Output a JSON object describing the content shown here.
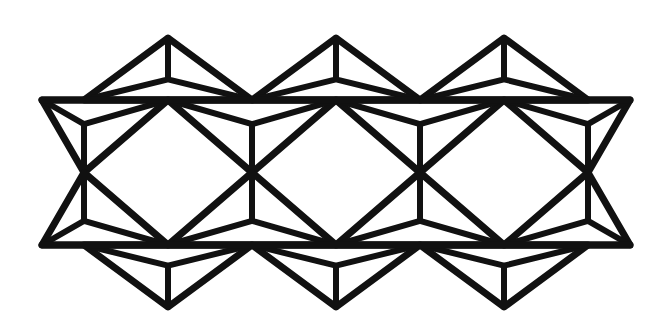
{
  "figure": {
    "type": "geometric-line-diagram",
    "caption": "",
    "background_color": "#ffffff",
    "stroke_color": "#111111",
    "canvas": {
      "width": 669,
      "height": 333
    }
  },
  "geometry": {
    "description": "Kagome-like strip: a band bounded by two long horizontal rails, filled by alternating up/down triangles; each triangle is subdivided by three spokes meeting at its centroid.",
    "side_length": 168,
    "triangle_height": 145,
    "half_side": 84,
    "rail_top_y": 100,
    "rail_bottom_y": 245,
    "mid_y": 172.5,
    "apex_top_y": 38,
    "apex_bottom_y": 307,
    "rail_x_start": 42,
    "rail_x_end": 630,
    "node_step_x": 84,
    "top_nodes_x": [
      42,
      126,
      210,
      294,
      378,
      462,
      546,
      630
    ],
    "bottom_nodes_x": [
      42,
      126,
      210,
      294,
      378,
      462,
      546,
      630
    ],
    "up_triangle_apex_x": [
      168,
      336,
      504
    ],
    "down_triangle_apex_x": [
      168,
      336,
      504
    ],
    "mid_cross_x": [
      84,
      252,
      420,
      588
    ],
    "stroke_width_outer": 7,
    "stroke_width_inner": 6
  },
  "chart_data": {
    "type": "line",
    "xlabel": "",
    "ylabel": "",
    "xlim": [
      0,
      669
    ],
    "ylim": [
      333,
      0
    ],
    "grid": false,
    "legend": "none",
    "series": [
      {
        "name": "rail-top",
        "kind": "polyline",
        "points": [
          [
            42,
            100
          ],
          [
            630,
            100
          ]
        ]
      },
      {
        "name": "rail-bottom",
        "kind": "polyline",
        "points": [
          [
            42,
            245
          ],
          [
            630,
            245
          ]
        ]
      },
      {
        "name": "triangle-up-top-1",
        "kind": "polygon",
        "points": [
          [
            84,
            100
          ],
          [
            252,
            100
          ],
          [
            168,
            38
          ]
        ],
        "centroid": [
          168,
          79.3
        ]
      },
      {
        "name": "triangle-up-top-2",
        "kind": "polygon",
        "points": [
          [
            252,
            100
          ],
          [
            420,
            100
          ],
          [
            336,
            38
          ]
        ],
        "centroid": [
          336,
          79.3
        ]
      },
      {
        "name": "triangle-up-top-3",
        "kind": "polygon",
        "points": [
          [
            420,
            100
          ],
          [
            588,
            100
          ],
          [
            504,
            38
          ]
        ],
        "centroid": [
          504,
          79.3
        ]
      },
      {
        "name": "triangle-down-bottom-1",
        "kind": "polygon",
        "points": [
          [
            84,
            245
          ],
          [
            252,
            245
          ],
          [
            168,
            307
          ]
        ],
        "centroid": [
          168,
          265.7
        ]
      },
      {
        "name": "triangle-down-bottom-2",
        "kind": "polygon",
        "points": [
          [
            252,
            245
          ],
          [
            420,
            245
          ],
          [
            336,
            307
          ]
        ],
        "centroid": [
          336,
          265.7
        ]
      },
      {
        "name": "triangle-down-bottom-3",
        "kind": "polygon",
        "points": [
          [
            420,
            245
          ],
          [
            588,
            245
          ],
          [
            504,
            307
          ]
        ],
        "centroid": [
          504,
          265.7
        ]
      },
      {
        "name": "triangle-down-upper-row-1",
        "kind": "polygon",
        "points": [
          [
            168,
            100
          ],
          [
            336,
            100
          ],
          [
            252,
            172.5
          ]
        ],
        "centroid": [
          252,
          124.2
        ]
      },
      {
        "name": "triangle-down-upper-row-2",
        "kind": "polygon",
        "points": [
          [
            336,
            100
          ],
          [
            504,
            100
          ],
          [
            420,
            172.5
          ]
        ],
        "centroid": [
          420,
          124.2
        ]
      },
      {
        "name": "triangle-down-upper-row-left-half",
        "kind": "polygon",
        "points": [
          [
            42,
            100
          ],
          [
            168,
            100
          ],
          [
            84,
            172.5
          ]
        ],
        "centroid": [
          84,
          124.2
        ]
      },
      {
        "name": "triangle-down-upper-row-right-half",
        "kind": "polygon",
        "points": [
          [
            504,
            100
          ],
          [
            630,
            100
          ],
          [
            588,
            172.5
          ]
        ],
        "centroid": [
          588,
          124.2
        ]
      },
      {
        "name": "triangle-up-lower-row-1",
        "kind": "polygon",
        "points": [
          [
            168,
            245
          ],
          [
            336,
            245
          ],
          [
            252,
            172.5
          ]
        ],
        "centroid": [
          252,
          220.8
        ]
      },
      {
        "name": "triangle-up-lower-row-2",
        "kind": "polygon",
        "points": [
          [
            336,
            245
          ],
          [
            504,
            245
          ],
          [
            420,
            172.5
          ]
        ],
        "centroid": [
          420,
          220.8
        ]
      },
      {
        "name": "triangle-up-lower-row-left-half",
        "kind": "polygon",
        "points": [
          [
            42,
            245
          ],
          [
            168,
            245
          ],
          [
            84,
            172.5
          ]
        ],
        "centroid": [
          84,
          220.8
        ]
      },
      {
        "name": "triangle-up-lower-row-right-half",
        "kind": "polygon",
        "points": [
          [
            504,
            245
          ],
          [
            630,
            245
          ],
          [
            588,
            172.5
          ]
        ],
        "centroid": [
          588,
          220.8
        ]
      },
      {
        "name": "hex-void-1",
        "kind": "polygon-open",
        "points": [
          [
            84,
            172.5
          ],
          [
            168,
            100
          ],
          [
            336,
            100
          ],
          [
            420,
            172.5
          ],
          [
            336,
            245
          ],
          [
            168,
            245
          ]
        ]
      },
      {
        "name": "hex-void-2",
        "kind": "polygon-open",
        "points": [
          [
            252,
            172.5
          ],
          [
            336,
            100
          ],
          [
            504,
            100
          ],
          [
            588,
            172.5
          ],
          [
            504,
            245
          ],
          [
            336,
            245
          ]
        ]
      }
    ]
  }
}
